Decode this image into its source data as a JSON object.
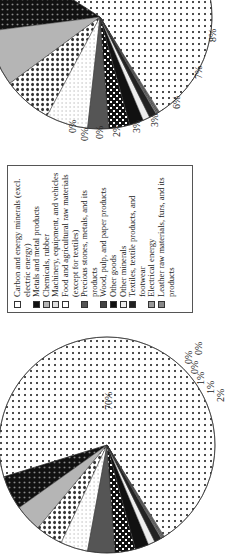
{
  "chart_data": [
    {
      "type": "pie",
      "title": "",
      "position": "right",
      "categories": [
        "Carbon and energy minerals (excl. electric energy)",
        "Metals and metal products",
        "Chemicals, rubber",
        "Machinery, equipment, and vehicles",
        "Food and agricultural raw materials (except for textiles)",
        "Precious stones, metals, and its products",
        "Wood, pulp, and paper products",
        "Other goods",
        "Other minerals",
        "Textiles, textile products, and footwear",
        "Electrical energy",
        "Leather raw materials, furs, and its products"
      ],
      "values": [
        57,
        11,
        8,
        7,
        6,
        3,
        3,
        2,
        1,
        1,
        0,
        0,
        0
      ],
      "labels_visible": [
        "11%",
        "8%",
        "7%",
        "6%",
        "3%",
        "3%",
        "2%",
        "0%",
        "0%",
        "0%"
      ]
    },
    {
      "type": "pie",
      "title": "",
      "position": "left",
      "values": [
        70,
        5,
        4,
        4,
        4,
        4,
        3,
        2,
        1,
        1,
        0,
        0,
        0
      ],
      "labels_visible": [
        "70%",
        "2%",
        "1%",
        "1%",
        "0%",
        "0%",
        "0%"
      ]
    }
  ],
  "legend": {
    "items": [
      {
        "label": "Carbon and energy minerals (excl. electric energy)",
        "swatch": "dots-light"
      },
      {
        "label": "Metals and metal products",
        "swatch": "dots-dark"
      },
      {
        "label": "Chemicals, rubber",
        "swatch": "gray"
      },
      {
        "label": "Machinery, equipment, and vehicles",
        "swatch": "check"
      },
      {
        "label": "Food and agricultural raw materials (except for textiles)",
        "swatch": "white"
      },
      {
        "label": "Precious stones, metals, and its products",
        "swatch": "dark-gray"
      },
      {
        "label": "Wood, pulp, and paper products",
        "swatch": "crosshatch"
      },
      {
        "label": "Other goods",
        "swatch": "black"
      },
      {
        "label": "Other minerals",
        "swatch": "light"
      },
      {
        "label": "Textiles, textile products, and footwear",
        "swatch": "near-black"
      },
      {
        "label": "Electrical energy",
        "swatch": "mid-gray"
      },
      {
        "label": "Leather raw materials, furs, and its products",
        "swatch": "gray2"
      }
    ]
  }
}
